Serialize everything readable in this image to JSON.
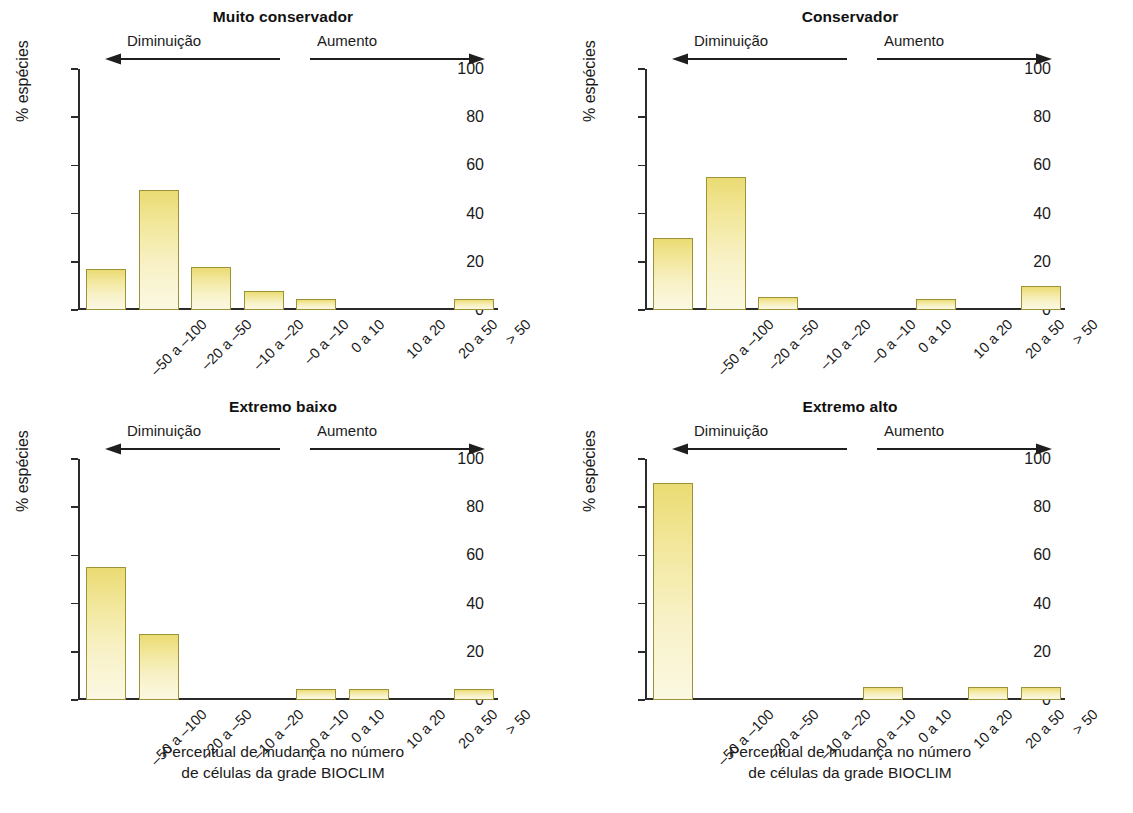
{
  "figure": {
    "panel_layout": "2x2",
    "background": "#ffffff",
    "bar_fill_top": "#eadb73",
    "bar_fill_bottom": "#fbf8e2",
    "bar_border": "#9c9237",
    "axis_color": "#2b2b2b"
  },
  "common": {
    "categories": [
      "–50 a –100",
      "–20 a –50",
      "–10 a –20",
      "–0 a –10",
      "0 a 10",
      "10 a 20",
      "20 a 50",
      "> 50"
    ],
    "ylabel": "% espécies",
    "yticks": [
      "0",
      "20",
      "40",
      "60",
      "80",
      "100"
    ],
    "ylim": [
      0,
      100
    ],
    "annotation_decrease": "Diminuição",
    "annotation_increase": "Aumento",
    "xcaption_line1": "Percentual de mudança no número",
    "xcaption_line2": "de células da grade BIOCLIM"
  },
  "chart_data": [
    {
      "type": "bar",
      "title": "Muito conservador",
      "panel": "top-left",
      "categories": [
        "–50 a –100",
        "–20 a –50",
        "–10 a –20",
        "–0 a –10",
        "0 a 10",
        "10 a 20",
        "20 a 50",
        "> 50"
      ],
      "values": [
        17,
        50,
        18,
        8,
        4.5,
        0,
        0,
        4.5
      ],
      "xlabel": "Percentual de mudança no número de células da grade BIOCLIM",
      "ylabel": "% espécies",
      "ylim": [
        0,
        100
      ],
      "yticks": [
        0,
        20,
        40,
        60,
        80,
        100
      ],
      "grid": false,
      "legend": "none",
      "annotations": [
        "Diminuição",
        "Aumento"
      ]
    },
    {
      "type": "bar",
      "title": "Conservador",
      "panel": "top-right",
      "categories": [
        "–50 a –100",
        "–20 a –50",
        "–10 a –20",
        "–0 a –10",
        "0 a 10",
        "10 a 20",
        "20 a 50",
        "> 50"
      ],
      "values": [
        30,
        55,
        5.5,
        0,
        0,
        4.5,
        0,
        10
      ],
      "xlabel": "Percentual de mudança no número de células da grade BIOCLIM",
      "ylabel": "% espécies",
      "ylim": [
        0,
        100
      ],
      "yticks": [
        0,
        20,
        40,
        60,
        80,
        100
      ],
      "grid": false,
      "legend": "none",
      "annotations": [
        "Diminuição",
        "Aumento"
      ]
    },
    {
      "type": "bar",
      "title": "Extremo baixo",
      "panel": "bottom-left",
      "categories": [
        "–50 a –100",
        "–20 a –50",
        "–10 a –20",
        "–0 a –10",
        "0 a 10",
        "10 a 20",
        "20 a 50",
        "> 50"
      ],
      "values": [
        55,
        27.5,
        0,
        0,
        4.5,
        4.5,
        0,
        4.5
      ],
      "xlabel": "Percentual de mudança no número de células da grade BIOCLIM",
      "ylabel": "% espécies",
      "ylim": [
        0,
        100
      ],
      "yticks": [
        0,
        20,
        40,
        60,
        80,
        100
      ],
      "grid": false,
      "legend": "none",
      "annotations": [
        "Diminuição",
        "Aumento"
      ]
    },
    {
      "type": "bar",
      "title": "Extremo alto",
      "panel": "bottom-right",
      "categories": [
        "–50 a –100",
        "–20 a –50",
        "–10 a –20",
        "–0 a –10",
        "0 a 10",
        "10 a 20",
        "20 a 50",
        "> 50"
      ],
      "values": [
        90,
        0,
        0,
        0,
        5.5,
        0,
        5.5,
        5.5
      ],
      "xlabel": "Percentual de mudança no número de células da grade BIOCLIM",
      "ylabel": "% espécies",
      "ylim": [
        0,
        100
      ],
      "yticks": [
        0,
        20,
        40,
        60,
        80,
        100
      ],
      "grid": false,
      "legend": "none",
      "annotations": [
        "Diminuição",
        "Aumento"
      ]
    }
  ]
}
